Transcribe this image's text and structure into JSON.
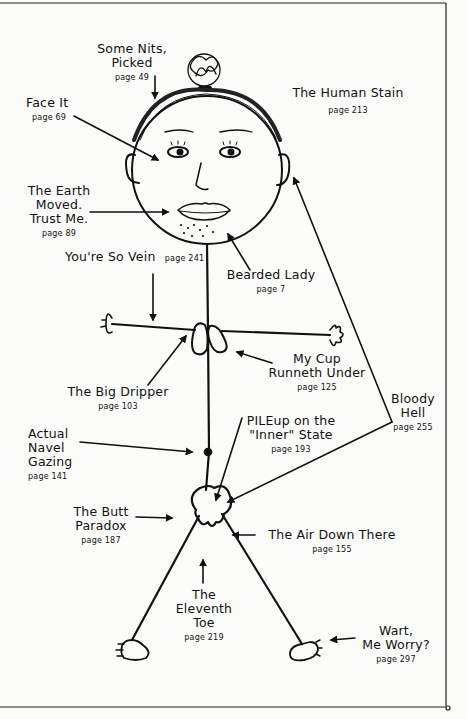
{
  "diagram": {
    "type": "annotated-body-map",
    "figure": "hand-drawn stick figure with labeled body parts",
    "labels": [
      {
        "id": "some-nits-picked",
        "title_lines": [
          "Some Nits,",
          "Picked"
        ],
        "page": "page 49",
        "target": "hair / scalp"
      },
      {
        "id": "face-it",
        "title_lines": [
          "Face It"
        ],
        "page": "page 69",
        "target": "face / cheek"
      },
      {
        "id": "human-stain",
        "title_lines": [
          "The Human Stain"
        ],
        "page": "page 213",
        "target": "skin"
      },
      {
        "id": "earth-moved",
        "title_lines": [
          "The Earth",
          "Moved.",
          "Trust Me."
        ],
        "page": "page 89",
        "target": "mouth / lips"
      },
      {
        "id": "bearded-lady",
        "title_lines": [
          "Bearded Lady"
        ],
        "page": "page 7",
        "target": "chin stubble"
      },
      {
        "id": "so-vein",
        "title_lines": [
          "You're So Vein"
        ],
        "page": "page 241",
        "target": "arm"
      },
      {
        "id": "big-dripper",
        "title_lines": [
          "The Big Dripper"
        ],
        "page": "page 103",
        "target": "breast"
      },
      {
        "id": "cup-runneth",
        "title_lines": [
          "My Cup",
          "Runneth Under"
        ],
        "page": "page 125",
        "target": "breast"
      },
      {
        "id": "bloody-hell",
        "title_lines": [
          "Bloody",
          "Hell"
        ],
        "page": "page 255",
        "target": "ear and pelvis"
      },
      {
        "id": "navel-gazing",
        "title_lines": [
          "Actual",
          "Navel",
          "Gazing"
        ],
        "page": "page 141",
        "target": "navel"
      },
      {
        "id": "pileup",
        "title_lines": [
          "PILEup on the",
          "\"Inner\" State"
        ],
        "page": "page 193",
        "target": "bottom"
      },
      {
        "id": "butt-paradox",
        "title_lines": [
          "The Butt",
          "Paradox"
        ],
        "page": "page 187",
        "target": "butt"
      },
      {
        "id": "air-down-there",
        "title_lines": [
          "The Air Down There"
        ],
        "page": "page 155",
        "target": "pelvis"
      },
      {
        "id": "eleventh-toe",
        "title_lines": [
          "The",
          "Eleventh",
          "Toe"
        ],
        "page": "page 219",
        "target": "crotch"
      },
      {
        "id": "wart-worry",
        "title_lines": [
          "Wart,",
          "Me Worry?"
        ],
        "page": "page 297",
        "target": "foot"
      }
    ],
    "colors": {
      "ink": "#111111",
      "paper": "#fbfbf9"
    }
  }
}
